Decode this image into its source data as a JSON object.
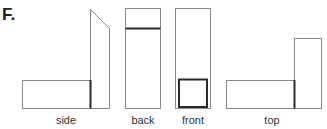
{
  "figure": {
    "label": "F.",
    "views": [
      {
        "name": "side",
        "label": "side"
      },
      {
        "name": "back",
        "label": "back"
      },
      {
        "name": "front",
        "label": "front"
      },
      {
        "name": "top",
        "label": "top"
      }
    ]
  },
  "colors": {
    "outline": "#8a8a8a",
    "emphasis": "#2a2a2a",
    "background": "#ffffff"
  }
}
